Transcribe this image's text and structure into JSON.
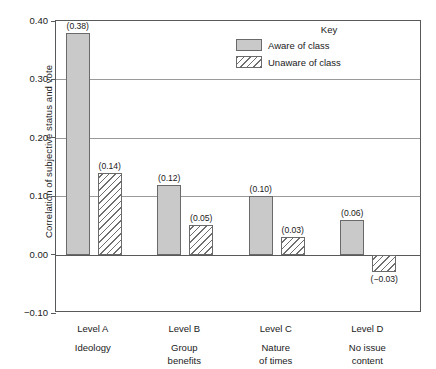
{
  "chart_data": {
    "type": "bar",
    "title": "",
    "xlabel": "",
    "ylabel": "Correlation of subjective status and vote",
    "ylim": [
      -0.1,
      0.4
    ],
    "yticks": [
      "0.40",
      "0.30",
      "0.20",
      "0.10",
      "0.00",
      "-0.10"
    ],
    "ytick_values": [
      0.4,
      0.3,
      0.2,
      0.1,
      0.0,
      -0.1
    ],
    "grid": true,
    "legend_position": "top-right",
    "legend_title": "Key",
    "categories": [
      "Level A",
      "Level B",
      "Level C",
      "Level D"
    ],
    "category_sublabels": [
      "Ideology",
      "Group benefits",
      "Nature of times",
      "No issue content"
    ],
    "series": [
      {
        "name": "Aware of class",
        "style": "solid",
        "values": [
          0.38,
          0.12,
          0.1,
          0.06
        ],
        "labels": [
          "(0.38)",
          "(0.12)",
          "(0.10)",
          "(0.06)"
        ]
      },
      {
        "name": "Unaware of class",
        "style": "hatched",
        "values": [
          0.14,
          0.05,
          0.03,
          -0.03
        ],
        "labels": [
          "(0.14)",
          "(0.05)",
          "(0.03)",
          "(−0.03)"
        ]
      }
    ]
  },
  "colors": {
    "solid_fill": "#c9c9c9",
    "hatch_line": "#6f6f6f",
    "bar_border": "#6a6a6a",
    "axis": "#58595b",
    "grid": "#9a9a9a",
    "text": "#1a1a1a",
    "background": "#ffffff"
  },
  "categories_sub_lines": [
    [
      "Ideology"
    ],
    [
      "Group",
      "benefits"
    ],
    [
      "Nature",
      "of times"
    ],
    [
      "No issue",
      "content"
    ]
  ]
}
